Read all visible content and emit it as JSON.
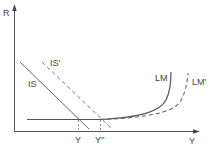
{
  "diagram": {
    "type": "IS-LM model",
    "axes": {
      "y_label": "R",
      "x_label": "Y"
    },
    "curves": [
      {
        "id": "IS",
        "label": "IS",
        "style": "solid"
      },
      {
        "id": "IS_prime",
        "label": "IS'",
        "style": "dashed"
      },
      {
        "id": "LM",
        "label": "LM",
        "style": "solid"
      },
      {
        "id": "LM_prime",
        "label": "LM'",
        "style": "dashed"
      }
    ],
    "x_markers": [
      {
        "label": "Y"
      },
      {
        "label": "Y''"
      }
    ],
    "colors": {
      "line": "#555555",
      "text": "#444444"
    }
  }
}
